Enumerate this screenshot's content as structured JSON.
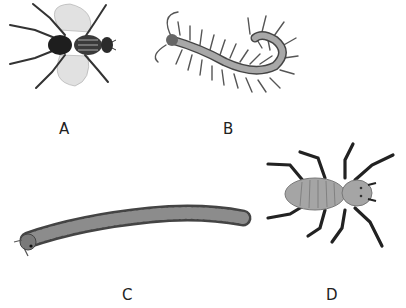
{
  "figure": {
    "panels": [
      {
        "id": "A",
        "label": "A",
        "subject": "housefly"
      },
      {
        "id": "B",
        "label": "B",
        "subject": "centipede"
      },
      {
        "id": "C",
        "label": "C",
        "subject": "millipede"
      },
      {
        "id": "D",
        "label": "D",
        "subject": "mite / arachnid-like creature"
      }
    ]
  },
  "colors": {
    "background": "#ffffff",
    "body_gray": "#9a9a9a",
    "dark": "#2a2a2a",
    "label": "#222222"
  }
}
